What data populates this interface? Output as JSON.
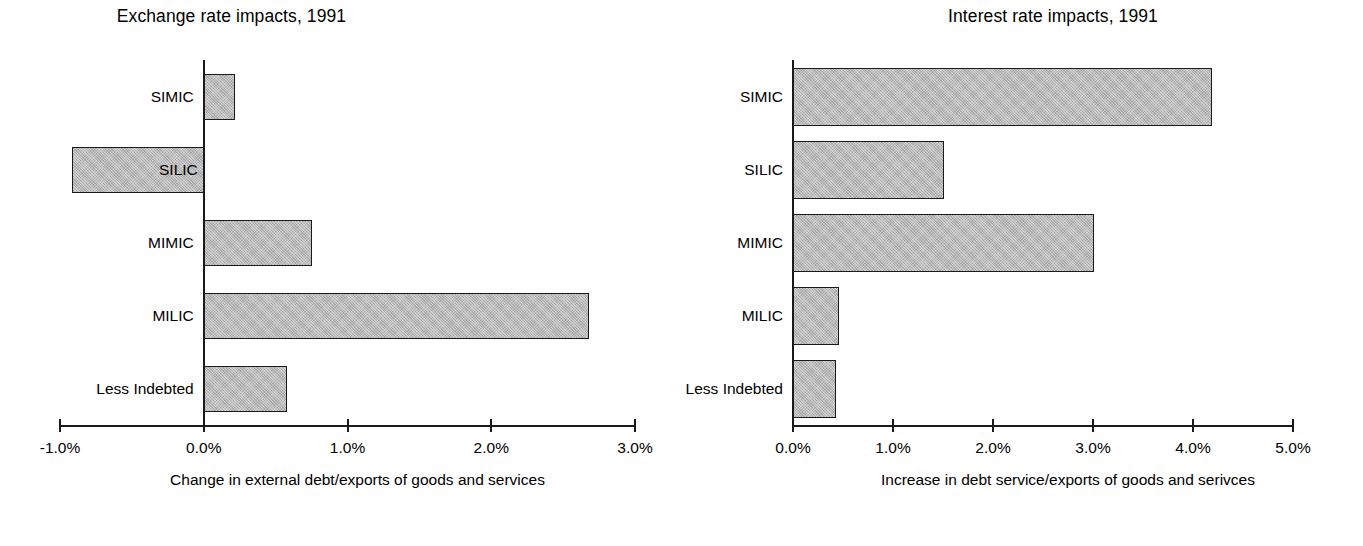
{
  "chart_data": [
    {
      "type": "bar",
      "orientation": "horizontal",
      "title": "Exchange rate impacts, 1991",
      "xlabel": "Change in external debt/exports of goods and services",
      "ylabel": "",
      "categories": [
        "SIMIC",
        "SILIC",
        "MIMIC",
        "MILIC",
        "Less Indebted"
      ],
      "values": [
        0.22,
        -0.92,
        0.75,
        2.68,
        0.58
      ],
      "value_suffix": "%",
      "xlim": [
        -1.0,
        3.0
      ],
      "xticks": [
        -1.0,
        0.0,
        1.0,
        2.0,
        3.0
      ],
      "xtick_labels": [
        "-1.0%",
        "0.0%",
        "1.0%",
        "2.0%",
        "3.0%"
      ],
      "grid": false,
      "legend": false,
      "bar_fill": "#b9b9b9",
      "bar_edge": "#1a1a1a"
    },
    {
      "type": "bar",
      "orientation": "horizontal",
      "title": "Interest rate impacts, 1991",
      "xlabel": "Increase in debt service/exports of goods and serivces",
      "ylabel": "",
      "categories": [
        "SIMIC",
        "SILIC",
        "MIMIC",
        "MILIC",
        "Less Indebted"
      ],
      "values": [
        4.19,
        1.51,
        3.01,
        0.46,
        0.43
      ],
      "value_suffix": "%",
      "xlim": [
        0.0,
        5.0
      ],
      "xticks": [
        0.0,
        1.0,
        2.0,
        3.0,
        4.0,
        5.0
      ],
      "xtick_labels": [
        "0.0%",
        "1.0%",
        "2.0%",
        "3.0%",
        "4.0%",
        "5.0%"
      ],
      "grid": false,
      "legend": false,
      "bar_fill": "#b9b9b9",
      "bar_edge": "#1a1a1a"
    }
  ]
}
